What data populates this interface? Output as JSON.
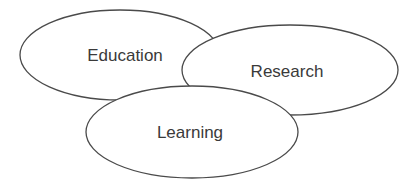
{
  "diagram": {
    "type": "overlapping-ellipses",
    "nodes": [
      {
        "id": "education",
        "label": "Education",
        "cx": 120,
        "cy": 55,
        "rx": 100,
        "ry": 45,
        "label_x": 125,
        "label_y": 55
      },
      {
        "id": "research",
        "label": "Research",
        "cx": 290,
        "cy": 70,
        "rx": 108,
        "ry": 45,
        "label_x": 287,
        "label_y": 71
      },
      {
        "id": "learning",
        "label": "Learning",
        "cx": 192,
        "cy": 132,
        "rx": 106,
        "ry": 46,
        "label_x": 190,
        "label_y": 132
      }
    ],
    "stroke_color": "#4a4a4a",
    "text_color": "#3a3a3a",
    "background": "#ffffff"
  }
}
